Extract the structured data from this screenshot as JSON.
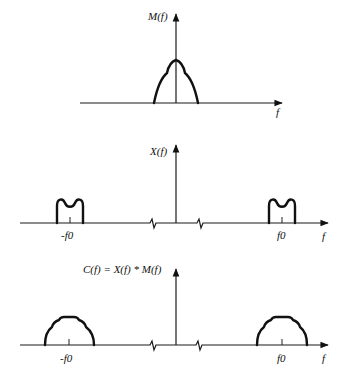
{
  "figure": {
    "panels": [
      {
        "id": "message-spectrum",
        "y_label": "M(f)",
        "x_label": "f",
        "description": "Baseband message spectrum centered at f = 0"
      },
      {
        "id": "carrier-spectrum",
        "y_label": "X(f)",
        "x_label": "f",
        "tick_labels": [
          "-f0",
          "f0"
        ],
        "description": "Spectrum components centered at -f0 and +f0"
      },
      {
        "id": "convolved-spectrum",
        "y_label": "C(f) = X(f) * M(f)",
        "x_label": "f",
        "tick_labels": [
          "-f0",
          "f0"
        ],
        "description": "Convolution result: broadened components centered at -f0 and +f0"
      }
    ],
    "colors": {
      "line": "#111111",
      "background": "#ffffff"
    }
  }
}
